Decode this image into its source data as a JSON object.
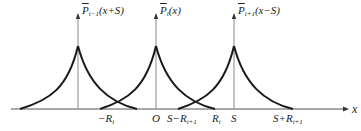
{
  "diagram": {
    "axis": {
      "label": "x",
      "y": 109,
      "x_start": 11,
      "x_end": 345
    },
    "peaks": [
      {
        "id": "p_prev",
        "x": 78,
        "label_base": "P",
        "label_sub": "i−1",
        "label_arg": "(x+S)",
        "left_end": 20,
        "right_end": 137
      },
      {
        "id": "p_cur",
        "x": 156,
        "label_base": "P",
        "label_sub": "i",
        "label_arg": "(x)",
        "left_end": 100,
        "right_end": 215
      },
      {
        "id": "p_next",
        "x": 234,
        "label_base": "P",
        "label_sub": "i+1",
        "label_arg": "(x−S)",
        "left_end": 178,
        "right_end": 293
      }
    ],
    "peak_y": 46,
    "tick_labels": [
      {
        "text": "−R",
        "sub": "i",
        "x": 98
      },
      {
        "text": "O",
        "sub": "",
        "x": 152
      },
      {
        "text": "S−R",
        "sub": "i+1",
        "x": 167
      },
      {
        "text": "R",
        "sub": "i",
        "x": 212
      },
      {
        "text": "S",
        "sub": "",
        "x": 231
      },
      {
        "text": "S+R",
        "sub": "i+1",
        "x": 273
      }
    ],
    "colors": {
      "curve": "#1a1a1a",
      "axis": "#555555",
      "guide": "#888888"
    }
  }
}
